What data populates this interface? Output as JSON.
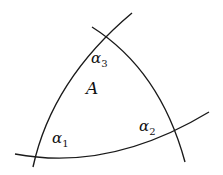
{
  "diagram": {
    "type": "curvilinear-triangle",
    "curves": [
      {
        "name": "left-curve",
        "path": "M33 167 Q52 80 132 13"
      },
      {
        "name": "right-curve",
        "path": "M92 27 Q160 70 185 162"
      },
      {
        "name": "bottom-curve",
        "path": "M15 154 Q110 172 209 112"
      }
    ],
    "stroke_color": "#1a1a1a",
    "labels": {
      "area": {
        "text": "A",
        "x": 86,
        "y": 80
      },
      "alpha1": {
        "base": "α",
        "sub": "1",
        "x": 52,
        "y": 131
      },
      "alpha2": {
        "base": "α",
        "sub": "2",
        "x": 139,
        "y": 119
      },
      "alpha3": {
        "base": "α",
        "sub": "3",
        "x": 91,
        "y": 51
      }
    }
  }
}
